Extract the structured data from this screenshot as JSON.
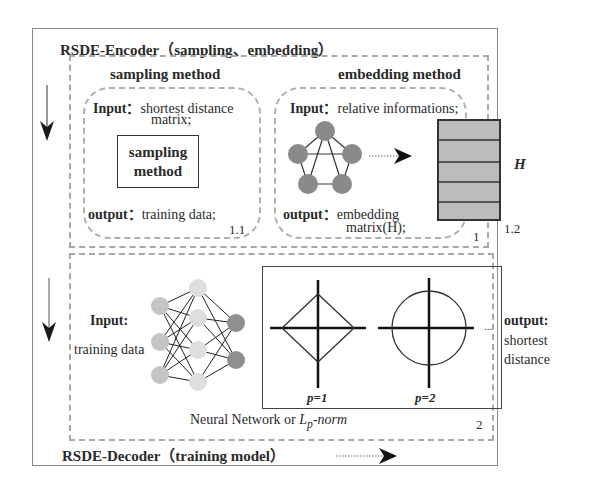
{
  "encoder": {
    "title": "RSDE-Encoder（sampling、embedding）",
    "section_number": "1",
    "sampling": {
      "heading": "sampling method",
      "input_label": "Input：",
      "input_text_line1": "shortest distance",
      "input_text_line2": "matrix;",
      "box_line1": "sampling",
      "box_line2": "method",
      "output_label": "output：",
      "output_text": "training data;",
      "number": "1.1"
    },
    "embedding": {
      "heading": "embedding method",
      "input_label": "Input：",
      "input_text": "relative informations;",
      "output_label": "output：",
      "output_text_line1": "embedding",
      "output_text_line2": "matrix(H);",
      "matrix_label": "H",
      "matrix_rows": 5,
      "number": "1.2",
      "graph_nodes": 5
    }
  },
  "decoder": {
    "title": "RSDE-Decoder（training model）",
    "section_number": "2",
    "input_label": "Input:",
    "input_text": "training data",
    "output_label": "output:",
    "output_text_line1": "shortest",
    "output_text_line2": "distance",
    "lp_labels": [
      "p=1",
      "p=2"
    ],
    "ellipsis": "...",
    "caption_prefix": "Neural Network or ",
    "caption_math": "L",
    "caption_sub": "p",
    "caption_suffix": "-norm",
    "network_layers": [
      3,
      4,
      2
    ]
  },
  "colors": {
    "node_dark": "#8a8a8a",
    "node_input": "#c4c4c4",
    "node_hidden": "#dedede",
    "node_output": "#8f8f8f",
    "matrix_fill": "#bcbcbc",
    "dash": "#a8a8a8"
  }
}
